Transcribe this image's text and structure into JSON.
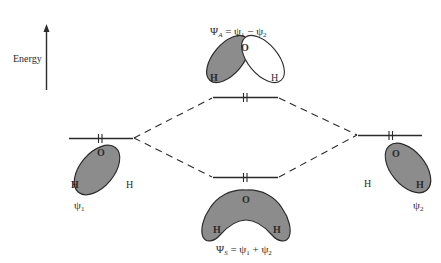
{
  "diagram": {
    "type": "molecular-orbital-energy-diagram",
    "axis": {
      "label": "Energy",
      "direction": "up"
    },
    "orbitals": [
      {
        "id": "psi1",
        "label": "ψ",
        "subscript": "1",
        "side": "left",
        "atoms": [
          "O",
          "H"
        ],
        "extra_atom": "H",
        "electrons": 2
      },
      {
        "id": "psi2",
        "label": "ψ",
        "subscript": "2",
        "side": "right",
        "atoms": [
          "O",
          "H"
        ],
        "extra_atom": "H",
        "electrons": 2
      },
      {
        "id": "psiA",
        "label_main": "Ψ",
        "label_sub": "A",
        "equation": "= ψ₁ − ψ₂",
        "atoms": [
          "O",
          "H",
          "H"
        ],
        "level": "upper",
        "electrons": 2
      },
      {
        "id": "psiS",
        "label_main": "Ψ",
        "label_sub": "S",
        "equation": "= ψ₁ + ψ₂",
        "atoms": [
          "O",
          "H",
          "H"
        ],
        "level": "lower",
        "electrons": 2
      }
    ],
    "colors": {
      "ink": "#2b2b2b",
      "lobe_fill": "#8c8c8c",
      "background": "#ffffff"
    }
  },
  "labels": {
    "energy": "Energy",
    "psiA_symbol": "Ψ",
    "psiA_sub": "A",
    "psiA_eq_a": " = ψ",
    "psiA_eq_a_sub": "1",
    "psiA_eq_b": " − ψ",
    "psiA_eq_b_sub": "2",
    "psiS_symbol": "Ψ",
    "psiS_sub": "S",
    "psiS_eq_a": " = ψ",
    "psiS_eq_a_sub": "1",
    "psiS_eq_b": " + ψ",
    "psiS_eq_b_sub": "2",
    "psi1_symbol": "ψ",
    "psi1_sub": "1",
    "psi2_symbol": "ψ",
    "psi2_sub": "2",
    "O": "O",
    "H": "H"
  }
}
